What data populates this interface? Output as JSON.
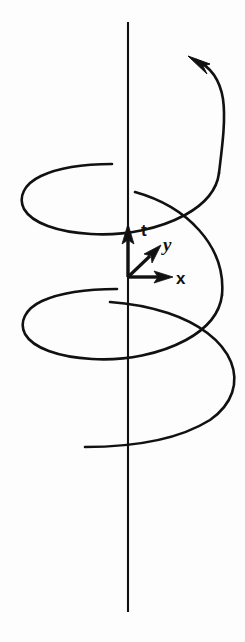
{
  "figure": {
    "background_color": "#fdfdfd",
    "ink_color": "#111111",
    "width": 245,
    "height": 642
  },
  "axes": {
    "time_axis": {
      "label": "t",
      "name": "time-axis",
      "orientation": "vertical",
      "label_x": 141,
      "label_y": 236,
      "font_size": 17
    },
    "y_axis": {
      "label": "y",
      "name": "y-axis",
      "orientation": "diagonal-up-right",
      "label_x": 163,
      "label_y": 251,
      "font_size": 19
    },
    "x_axis": {
      "label": "x",
      "name": "x-axis",
      "orientation": "horizontal-right",
      "label_x": 176,
      "label_y": 284,
      "font_size": 17
    }
  },
  "origin": {
    "x": 128,
    "y": 277
  },
  "vertical_line": {
    "x": 128,
    "y_top": 22,
    "y_bottom": 612
  },
  "helix": {
    "turns": 2.5,
    "direction": "counterclockwise-upward",
    "arrowhead": {
      "name": "helix-direction-arrowhead",
      "x": 189,
      "y": 57,
      "angle_deg": 218
    },
    "loops": [
      {
        "center_x": 128,
        "center_y": 196,
        "rx": 107,
        "ry": 34
      },
      {
        "center_x": 128,
        "center_y": 322,
        "rx": 107,
        "ry": 34
      },
      {
        "center_x": 128,
        "center_y": 410,
        "rx": 107,
        "ry": 38
      }
    ]
  }
}
